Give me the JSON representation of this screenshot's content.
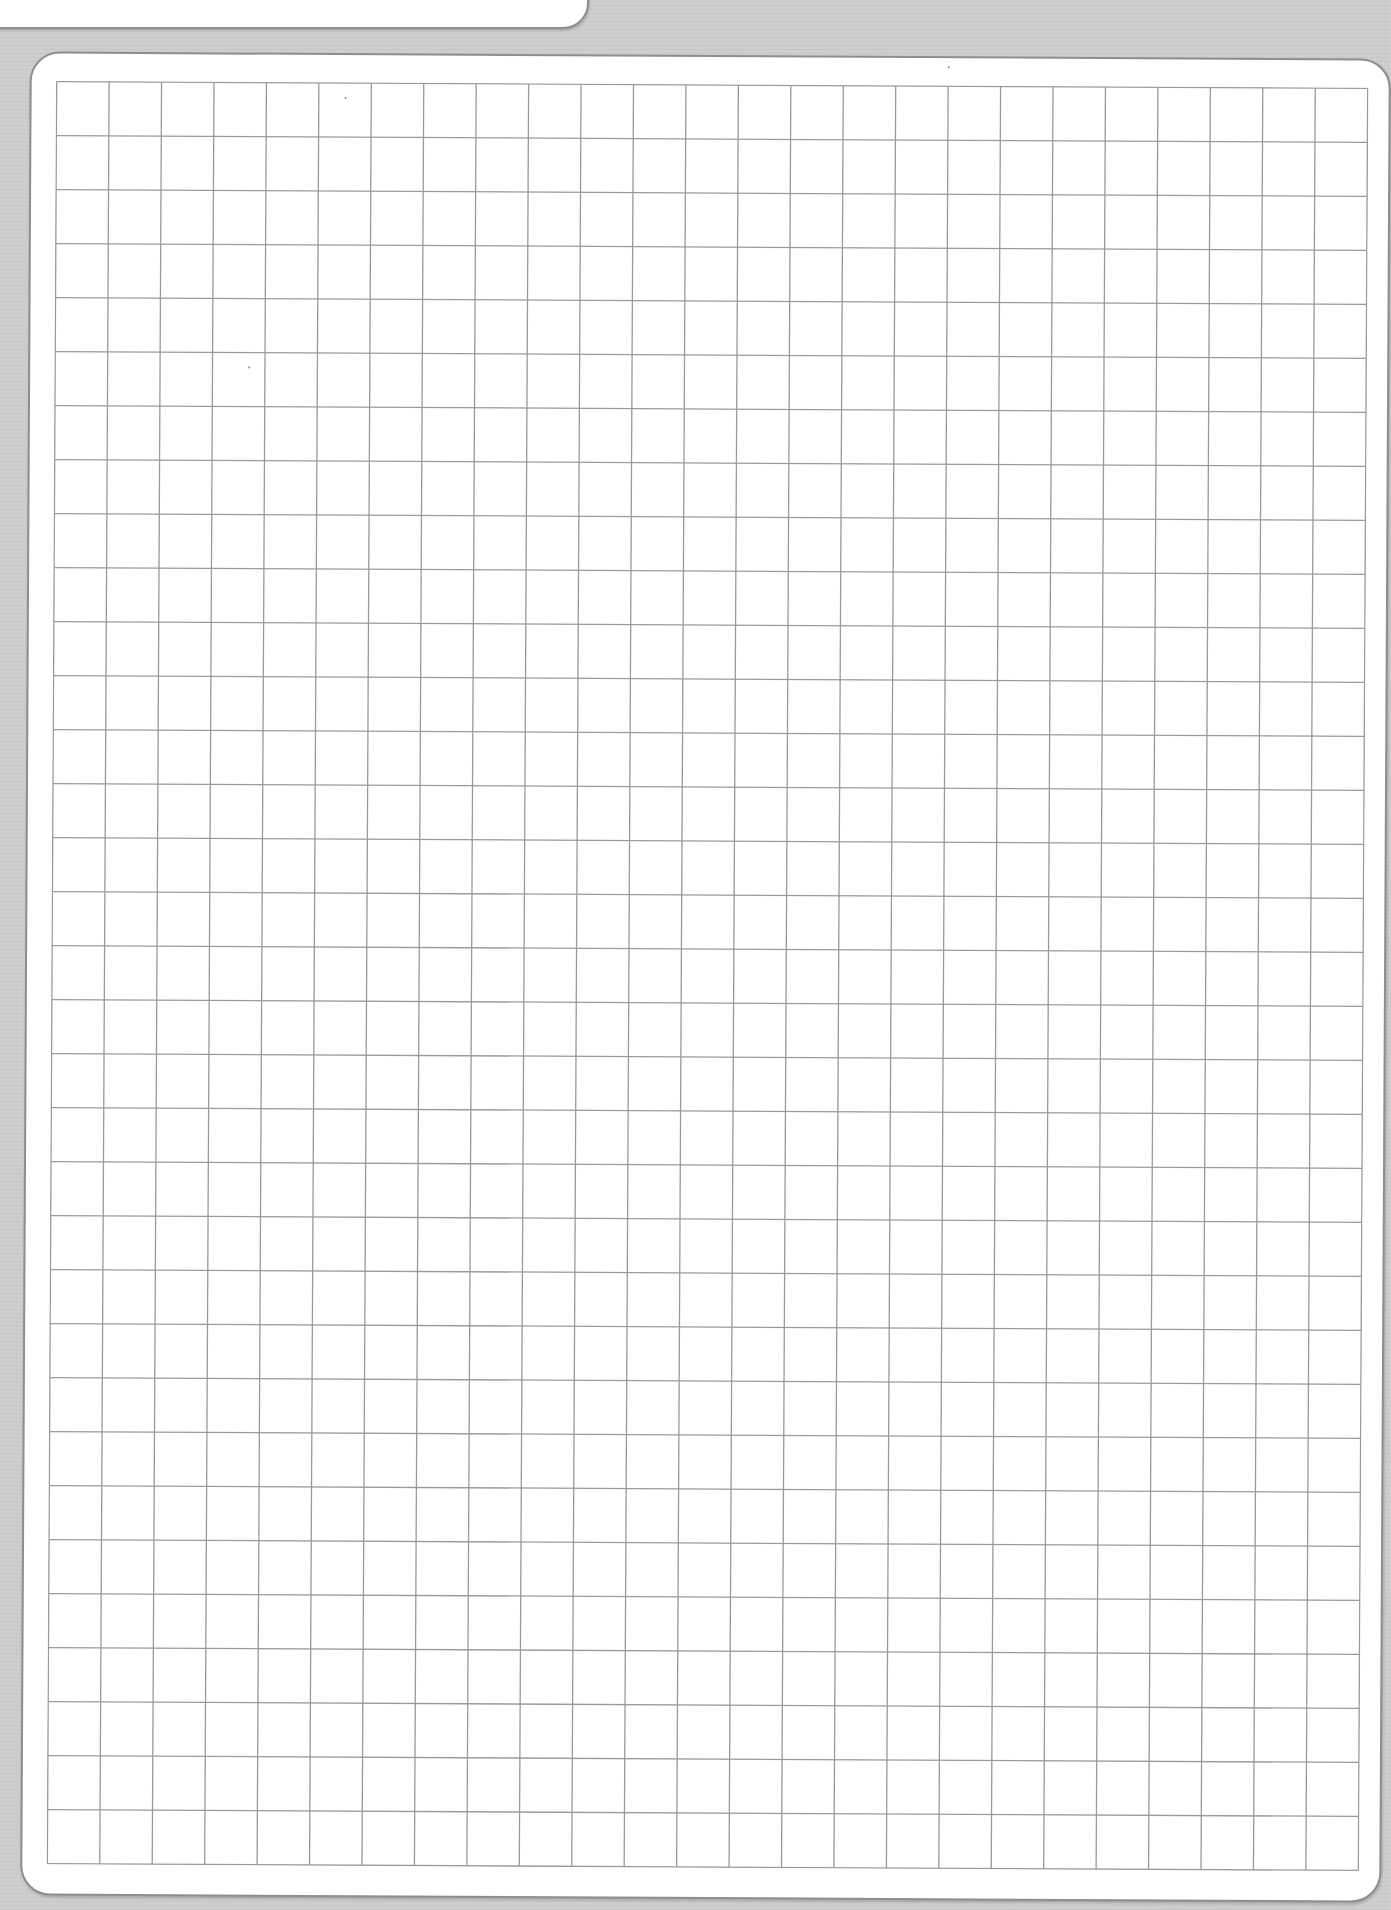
{
  "page": {
    "type": "grid-paper",
    "background_color": "#cdcdcd",
    "sheet_color": "#ffffff",
    "outline_color": "#8e8e8e",
    "grid_line_color": "#9a9a9a"
  },
  "grid": {
    "columns": 25,
    "rows": 33,
    "cell_width_px": 52.44,
    "cell_height_px": 54.0
  },
  "content": {
    "text": ""
  }
}
